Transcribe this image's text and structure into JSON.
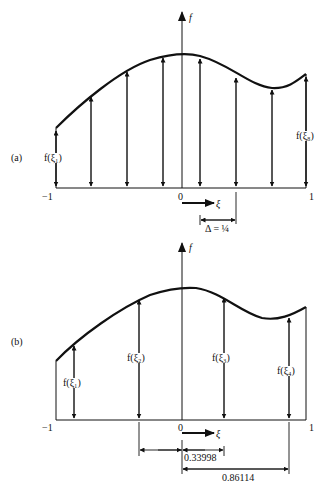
{
  "panel_a": {
    "label": "(a)",
    "axis_y_label": "f",
    "axis_x_label": "ξ",
    "tick_left": "−1",
    "tick_zero": "0",
    "tick_right": "1",
    "sample_first": "f(ξ₁)",
    "sample_last": "f(ξ₈)",
    "spacing_label": "Δ = ¼",
    "num_samples": 8
  },
  "panel_b": {
    "label": "(b)",
    "axis_y_label": "f",
    "axis_x_label": "ξ",
    "tick_left": "−1",
    "tick_zero": "0",
    "tick_right": "1",
    "samples": [
      "f(ξ₁)",
      "f(ξ₂)",
      "f(ξ₃)",
      "f(ξ₄)"
    ],
    "dim_inner": "0.33998",
    "dim_outer": "0.86114"
  }
}
